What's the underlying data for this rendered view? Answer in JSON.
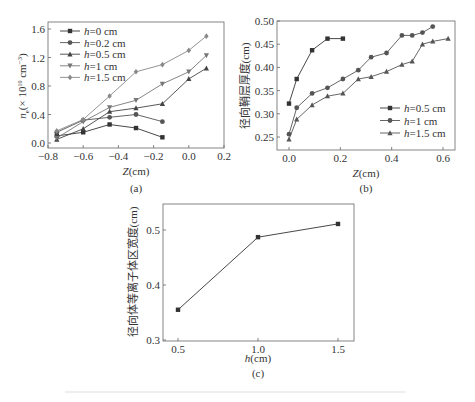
{
  "chart_data": [
    {
      "id": "a",
      "type": "line",
      "panel_label": "(a)",
      "xlabel_italic": "Z",
      "xlabel_rest": "(cm)",
      "ylabel": "n_e (×10^10 cm^-3)",
      "ylabel_parts": {
        "n": "n",
        "sub": "e",
        "rest": "(× 10",
        "exp": "10",
        "unit": " cm",
        "unit_exp": "−3",
        "close": ")"
      },
      "xlim": [
        -0.8,
        0.2
      ],
      "ylim": [
        0.0,
        1.6
      ],
      "xticks": [
        "−0.8",
        "−0.6",
        "−0.4",
        "−0.2",
        "0.0",
        "0.2"
      ],
      "xtick_values": [
        -0.8,
        -0.6,
        -0.4,
        -0.2,
        0.0,
        0.2
      ],
      "yticks": [
        "0.0",
        "0.4",
        "0.8",
        "1.2",
        "1.6"
      ],
      "ytick_values": [
        0.0,
        0.4,
        0.8,
        1.2,
        1.6
      ],
      "legend_position": "upper left",
      "series": [
        {
          "name": "h=0 cm",
          "h": "h",
          "rest": "=0 cm",
          "marker": "square",
          "color": "#333333",
          "x": [
            -0.75,
            -0.6,
            -0.45,
            -0.3,
            -0.15
          ],
          "y": [
            0.1,
            0.15,
            0.26,
            0.21,
            0.08
          ]
        },
        {
          "name": "h=0.2 cm",
          "h": "h",
          "rest": "=0.2 cm",
          "marker": "circle",
          "color": "#555555",
          "x": [
            -0.75,
            -0.6,
            -0.45,
            -0.3,
            -0.15
          ],
          "y": [
            0.15,
            0.32,
            0.36,
            0.4,
            0.3
          ]
        },
        {
          "name": "h=0.5 cm",
          "h": "h",
          "rest": "=0.5 cm",
          "marker": "triangle-up",
          "color": "#444444",
          "x": [
            -0.75,
            -0.6,
            -0.45,
            -0.3,
            -0.15,
            0.0,
            0.1
          ],
          "y": [
            0.05,
            0.2,
            0.44,
            0.49,
            0.55,
            0.9,
            1.05
          ]
        },
        {
          "name": "h=1 cm",
          "h": "h",
          "rest": "=1 cm",
          "marker": "triangle-down",
          "color": "#777777",
          "x": [
            -0.75,
            -0.6,
            -0.45,
            -0.3,
            -0.15,
            0.0,
            0.1
          ],
          "y": [
            0.07,
            0.3,
            0.5,
            0.6,
            0.83,
            1.0,
            1.23
          ]
        },
        {
          "name": "h=1.5 cm",
          "h": "h",
          "rest": "=1.5 cm",
          "marker": "diamond",
          "color": "#888888",
          "x": [
            -0.75,
            -0.6,
            -0.45,
            -0.3,
            -0.15,
            0.0,
            0.1
          ],
          "y": [
            0.17,
            0.33,
            0.66,
            1.0,
            1.1,
            1.3,
            1.5
          ]
        }
      ]
    },
    {
      "id": "b",
      "type": "line",
      "panel_label": "(b)",
      "xlabel_italic": "Z",
      "xlabel_rest": "(cm)",
      "ylabel": "径向鞘层厚度(cm)",
      "xlim": [
        -0.07,
        0.65
      ],
      "ylim": [
        0.22,
        0.5
      ],
      "xticks": [
        "0.0",
        "0.2",
        "0.4",
        "0.6"
      ],
      "xtick_values": [
        0.0,
        0.2,
        0.4,
        0.6
      ],
      "yticks": [
        "0.25",
        "0.30",
        "0.35",
        "0.40",
        "0.45",
        "0.50"
      ],
      "ytick_values": [
        0.25,
        0.3,
        0.35,
        0.4,
        0.45,
        0.5
      ],
      "legend_position": "lower right",
      "series": [
        {
          "name": "h=0.5 cm",
          "h": "h",
          "rest": "=0.5 cm",
          "marker": "square",
          "color": "#333333",
          "x": [
            0.0,
            0.03,
            0.09,
            0.15,
            0.21
          ],
          "y": [
            0.322,
            0.375,
            0.437,
            0.462,
            0.462
          ]
        },
        {
          "name": "h=1 cm",
          "h": "h",
          "rest": "=1 cm",
          "marker": "circle",
          "color": "#555555",
          "x": [
            0.0,
            0.03,
            0.09,
            0.15,
            0.21,
            0.27,
            0.32,
            0.38,
            0.44,
            0.48,
            0.52,
            0.56
          ],
          "y": [
            0.256,
            0.313,
            0.344,
            0.356,
            0.375,
            0.394,
            0.422,
            0.431,
            0.469,
            0.469,
            0.475,
            0.488
          ]
        },
        {
          "name": "h=1.5 cm",
          "h": "h",
          "rest": "=1.5 cm",
          "marker": "triangle-up",
          "color": "#555555",
          "x": [
            0.0,
            0.03,
            0.09,
            0.15,
            0.21,
            0.27,
            0.32,
            0.38,
            0.44,
            0.48,
            0.52,
            0.56,
            0.62
          ],
          "y": [
            0.245,
            0.288,
            0.319,
            0.338,
            0.344,
            0.375,
            0.38,
            0.391,
            0.406,
            0.413,
            0.45,
            0.456,
            0.462
          ]
        }
      ]
    },
    {
      "id": "c",
      "type": "line",
      "panel_label": "(c)",
      "xlabel_italic": "h",
      "xlabel_rest": "(cm)",
      "ylabel": "径向体等离子体区宽度(cm)",
      "xlim": [
        0.4,
        1.6
      ],
      "ylim": [
        0.3,
        0.55
      ],
      "xticks": [
        "0.5",
        "1.0",
        "1.5"
      ],
      "xtick_values": [
        0.5,
        1.0,
        1.5
      ],
      "yticks": [
        "0.3",
        "0.4",
        "0.5"
      ],
      "ytick_values": [
        0.3,
        0.4,
        0.5
      ],
      "legend_position": "none",
      "series": [
        {
          "name": "width",
          "marker": "square",
          "color": "#333333",
          "x": [
            0.5,
            1.0,
            1.5
          ],
          "y": [
            0.355,
            0.487,
            0.511
          ]
        }
      ]
    }
  ],
  "caption": ""
}
